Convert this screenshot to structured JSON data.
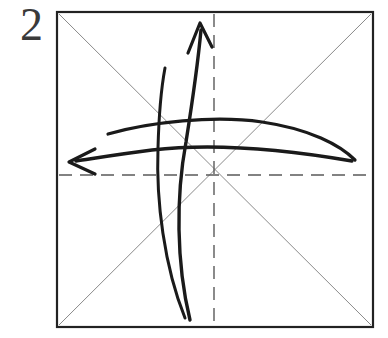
{
  "figure": {
    "kind": "origami-fold-diagram",
    "step_label": "2",
    "canvas": {
      "width": 388,
      "height": 338
    },
    "colors": {
      "paper_fill": "#ffffff",
      "paper_border": "#222222",
      "crease_diagonal": "#8a8a8a",
      "crease_dashed": "#5a5a5a",
      "fold_arrow": "#1a1a1a",
      "label": "#3a3a3a",
      "page_background": "#ffffff"
    },
    "stroke_widths": {
      "paper_border": 2.2,
      "crease_diagonal": 1.0,
      "crease_dashed": 1.4,
      "fold_arrow": 3.0
    }
  },
  "paper": {
    "name": "square-sheet",
    "x": 57,
    "y": 12,
    "width": 316,
    "height": 315,
    "center": {
      "x": 215,
      "y": 170
    }
  },
  "creases": [
    {
      "name": "diagonal-crease-tl-br",
      "style": "solid-thin",
      "from": {
        "x": 59,
        "y": 14
      },
      "to": {
        "x": 371,
        "y": 325
      }
    },
    {
      "name": "diagonal-crease-tr-bl",
      "style": "solid-thin",
      "from": {
        "x": 371,
        "y": 14
      },
      "to": {
        "x": 59,
        "y": 325
      }
    },
    {
      "name": "vertical-crease-dashed",
      "style": "dashed",
      "from": {
        "x": 214,
        "y": 14
      },
      "to": {
        "x": 214,
        "y": 326
      },
      "dash_pattern": "13 8"
    },
    {
      "name": "horizontal-crease-dashed",
      "style": "dashed",
      "from": {
        "x": 59,
        "y": 175
      },
      "to": {
        "x": 371,
        "y": 175
      },
      "dash_pattern": "13 8"
    }
  ],
  "fold_arrows": [
    {
      "name": "fold-arrow-up",
      "direction": "up",
      "description": "curved fold arrow sweeping from lower-right up to the top, arrowhead pointing up-left",
      "path": "M 190 320 C 176 262, 176 196, 186 142 C 192 104, 198 62, 201 30",
      "arrowhead": {
        "tip": {
          "x": 200,
          "y": 23
        },
        "barb_left": {
          "x": 188,
          "y": 53
        },
        "barb_right": {
          "x": 212,
          "y": 47
        }
      }
    },
    {
      "name": "fold-arrow-left",
      "direction": "left",
      "description": "curved fold arrow sweeping from the right edge across to the left, arrowhead pointing left",
      "path": "M 352 161 C 300 152, 220 142, 152 150 C 120 154, 96 158, 76 161",
      "arrowhead": {
        "tip": {
          "x": 69,
          "y": 162
        },
        "barb_top": {
          "x": 95,
          "y": 149
        },
        "barb_bottom": {
          "x": 95,
          "y": 174
        }
      }
    },
    {
      "name": "fold-arrow-tail-up",
      "direction": "tail",
      "description": "short curved tail stroke of the upward fold arrow",
      "path": "M 185 318 C 164 266, 156 200, 158 148 C 159 110, 162 84, 165 68"
    },
    {
      "name": "fold-arrow-tail-left",
      "direction": "tail",
      "description": "long curved tail stroke of the leftward fold arrow",
      "path": "M 108 134 C 150 122, 214 115, 262 122 C 310 129, 340 145, 355 160"
    }
  ],
  "accessibility": {
    "alt": "Step 2 of an origami diagram: a square sheet with two solid diagonal creases and two dashed center creases, overlaid with two curved fold arrows, one pointing up and one pointing left."
  }
}
